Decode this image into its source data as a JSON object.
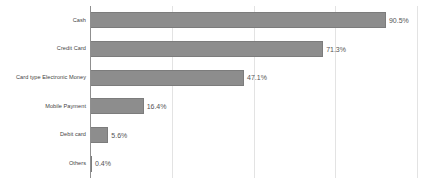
{
  "chart_data": {
    "type": "bar",
    "orientation": "horizontal",
    "title": "",
    "subtitle": "",
    "xlabel": "",
    "ylabel": "",
    "xlim": [
      0,
      100
    ],
    "grid": true,
    "gridline_values": [
      25,
      50,
      75,
      100
    ],
    "legend": false,
    "legend_position": "none",
    "value_suffix": "%",
    "series_color": "#8d8d8d",
    "gridline_color": "#e3e3e3",
    "axis_color": "#8f8f8f",
    "categories": [
      "Cash",
      "Credit Card",
      "Card type Electronic Money",
      "Mobile Payment",
      "Debit card",
      "Others"
    ],
    "values": [
      90.5,
      71.3,
      47.1,
      16.4,
      5.6,
      0.4
    ],
    "value_labels": [
      "90.5%",
      "71.3%",
      "47.1%",
      "16.4%",
      "5.6%",
      "0.4%"
    ]
  }
}
